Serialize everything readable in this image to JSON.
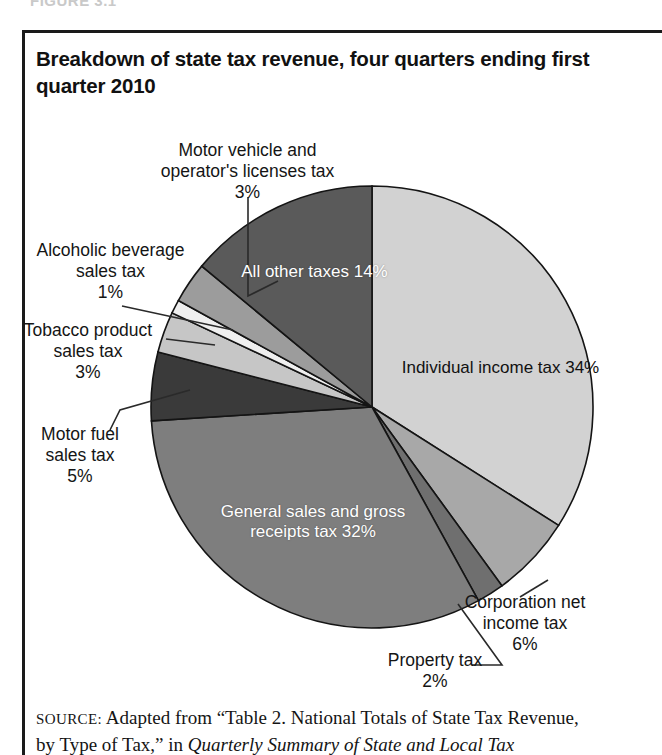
{
  "figure": {
    "top_cut_text": "FIGURE 3.1",
    "title": "Breakdown of state tax revenue, four quarters ending first quarter 2010"
  },
  "source": {
    "label": "SOURCE:",
    "line1_rest": " Adapted from “Table 2. National Totals of State Tax Revenue,",
    "line2_lead": "by Type of Tax,” in ",
    "line2_italic": "Quarterly Summary of State and Local Tax"
  },
  "chart_data": {
    "type": "pie",
    "title": "Breakdown of state tax revenue, four quarters ending first quarter 2010",
    "unit": "percent",
    "start_angle_deg": 0,
    "direction": "clockwise",
    "total": 100,
    "categories": [
      "Individual income tax",
      "Corporation net income tax",
      "Property tax",
      "General sales and gross receipts tax",
      "Motor fuel sales tax",
      "Tobacco product sales tax",
      "Alcoholic beverage sales tax",
      "Motor vehicle and operator's licenses tax",
      "All other taxes"
    ],
    "values": [
      34,
      6,
      2,
      32,
      5,
      3,
      1,
      3,
      14
    ],
    "colors": [
      "#d2d2d2",
      "#a8a8a8",
      "#6f6f6f",
      "#7e7e7e",
      "#3a3a3a",
      "#c6c6c6",
      "#efefef",
      "#9c9c9c",
      "#5a5a5a"
    ],
    "label_placement": [
      "inside",
      "outside",
      "outside",
      "inside",
      "outside",
      "outside",
      "outside",
      "outside",
      "inside"
    ],
    "legend": "none",
    "slices": [
      {
        "name": "Individual income tax",
        "value": 34,
        "display": "34%",
        "color": "#d2d2d2",
        "label_position": "inside"
      },
      {
        "name": "Corporation net income tax",
        "value": 6,
        "display": "6%",
        "color": "#a8a8a8",
        "label_position": "outside-right"
      },
      {
        "name": "Property tax",
        "value": 2,
        "display": "2%",
        "color": "#6f6f6f",
        "label_position": "outside-bottom"
      },
      {
        "name": "General sales and gross receipts tax",
        "value": 32,
        "display": "32%",
        "color": "#7e7e7e",
        "label_position": "inside"
      },
      {
        "name": "Motor fuel sales tax",
        "value": 5,
        "display": "5%",
        "color": "#3a3a3a",
        "label_position": "outside-left"
      },
      {
        "name": "Tobacco product sales tax",
        "value": 3,
        "display": "3%",
        "color": "#c6c6c6",
        "label_position": "outside-left"
      },
      {
        "name": "Alcoholic beverage sales tax",
        "value": 1,
        "display": "1%",
        "color": "#efefef",
        "label_position": "outside-left"
      },
      {
        "name": "Motor vehicle and operator's licenses tax",
        "value": 3,
        "display": "3%",
        "color": "#9c9c9c",
        "label_position": "outside-top"
      },
      {
        "name": "All other taxes",
        "value": 14,
        "display": "14%",
        "color": "#5a5a5a",
        "label_position": "inside"
      }
    ]
  },
  "labels": {
    "motor_vehicle": "Motor vehicle and\noperator's licenses tax\n3%",
    "alcoholic": "Alcoholic beverage\nsales tax\n1%",
    "tobacco": "Tobacco product\nsales tax\n3%",
    "motor_fuel": "Motor fuel\nsales tax\n5%",
    "corporation": "Corporation net\nincome tax\n6%",
    "property": "Property tax\n2%",
    "all_other": "All other taxes\n14%",
    "individual": "Individual income tax\n34%",
    "general_sales": "General sales and gross\nreceipts tax\n32%"
  }
}
